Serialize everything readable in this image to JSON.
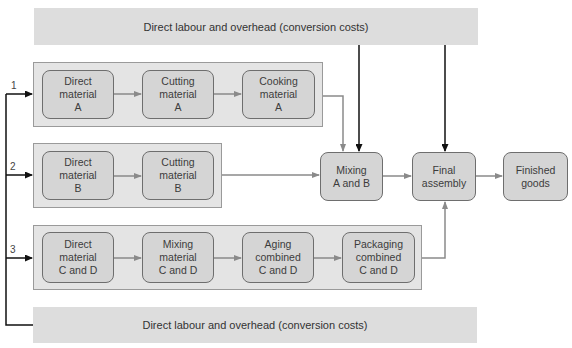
{
  "banners": {
    "top": "Direct labour and overhead (conversion costs)",
    "bottom": "Direct labour and overhead (conversion costs)"
  },
  "process_numbers": [
    "1",
    "2",
    "3"
  ],
  "row1": [
    {
      "l1": "Direct",
      "l2": "material",
      "l3": "A"
    },
    {
      "l1": "Cutting",
      "l2": "material",
      "l3": "A"
    },
    {
      "l1": "Cooking",
      "l2": "material",
      "l3": "A"
    }
  ],
  "row2": [
    {
      "l1": "Direct",
      "l2": "material",
      "l3": "B"
    },
    {
      "l1": "Cutting",
      "l2": "material",
      "l3": "B"
    }
  ],
  "row3": [
    {
      "l1": "Direct",
      "l2": "material",
      "l3": "C and D"
    },
    {
      "l1": "Mixing",
      "l2": "material",
      "l3": "C and D"
    },
    {
      "l1": "Aging",
      "l2": "combined",
      "l3": "C and D"
    },
    {
      "l1": "Packaging",
      "l2": "combined",
      "l3": "C and D"
    }
  ],
  "mixing": {
    "l1": "Mixing",
    "l2": "A and B"
  },
  "final": {
    "l1": "Final",
    "l2": "assembly"
  },
  "finished": {
    "l1": "Finished",
    "l2": "goods"
  },
  "colors": {
    "banner": "#dddddd",
    "container": "#e4e4e4",
    "box": "#d5d5d5",
    "arrow_gray": "#8a8a8a",
    "arrow_black": "#111111"
  }
}
